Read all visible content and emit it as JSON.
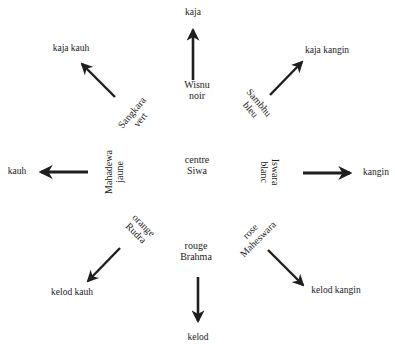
{
  "diagram": {
    "center": {
      "line1": "centre",
      "line2": "Siwa"
    },
    "directions": [
      {
        "key": "n",
        "direction": "kaja",
        "deity": "Wisnu",
        "color": "noir"
      },
      {
        "key": "ne",
        "direction": "kaja kangin",
        "deity": "Sambhu",
        "color": "bleu"
      },
      {
        "key": "e",
        "direction": "kangin",
        "deity": "Iswara",
        "color": "blanc"
      },
      {
        "key": "se",
        "direction": "kelod kangin",
        "deity": "Maheswara",
        "color": "rose"
      },
      {
        "key": "s",
        "direction": "kelod",
        "deity": "Brahma",
        "color": "rouge"
      },
      {
        "key": "sw",
        "direction": "kelod kauh",
        "deity": "Rudra",
        "color": "orange"
      },
      {
        "key": "w",
        "direction": "kauh",
        "deity": "Mahadewa",
        "color": "jaune"
      },
      {
        "key": "nw",
        "direction": "kaja kauh",
        "deity": "Sangkara",
        "color": "vert"
      }
    ],
    "arrow_color": "#1e1e1e"
  }
}
